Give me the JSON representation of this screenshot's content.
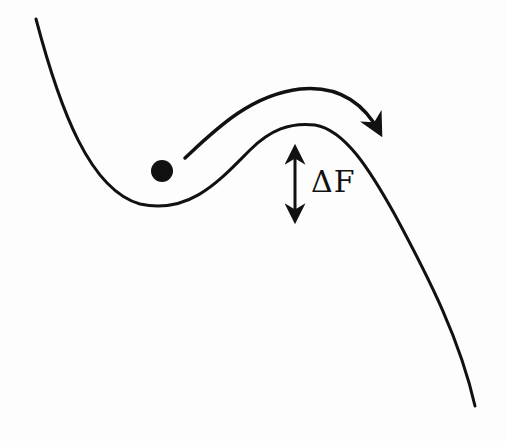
{
  "diagram": {
    "type": "free-energy-landscape",
    "barrier_label": "ΔF",
    "elements": [
      {
        "name": "energy-curve",
        "description": "landscape curve with local minimum and barrier"
      },
      {
        "name": "particle",
        "description": "ball resting in local minimum"
      },
      {
        "name": "transition-arrow",
        "description": "curved arrow over the barrier"
      },
      {
        "name": "barrier-height-arrow",
        "description": "double-headed vertical arrow indicating barrier height"
      }
    ],
    "colors": {
      "stroke": "#111111",
      "background": "#fdfdfd"
    }
  }
}
